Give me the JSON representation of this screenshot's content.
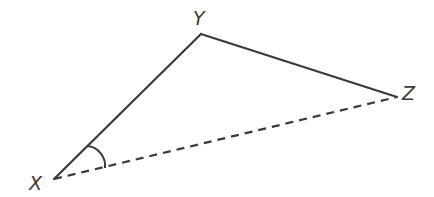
{
  "diagram": {
    "type": "triangle",
    "vertices": [
      {
        "label": "X",
        "x": 54,
        "y": 179
      },
      {
        "label": "Y",
        "x": 201,
        "y": 34
      },
      {
        "label": "Z",
        "x": 397,
        "y": 97
      }
    ],
    "edges": [
      {
        "from": "X",
        "to": "Y",
        "style": "solid"
      },
      {
        "from": "Y",
        "to": "Z",
        "style": "solid"
      },
      {
        "from": "X",
        "to": "Z",
        "style": "dashed"
      }
    ],
    "marked_angle": "X",
    "line_color": "#3a3a3a"
  },
  "labels": {
    "x": "X",
    "y": "Y",
    "z": "Z"
  }
}
